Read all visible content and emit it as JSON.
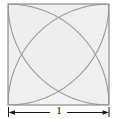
{
  "figure": {
    "square": {
      "side_label": "1",
      "x": 8,
      "y": 4,
      "size": 101,
      "stroke_color": "#8c8c8c",
      "stroke_width": 1.1,
      "fill_color": "#ffffff"
    },
    "arcs": {
      "count": 4,
      "description": "quarter circles of radius equal to the side, centered at each corner of the square",
      "stroke_color": "#9a9a9a",
      "stroke_width": 1.1,
      "radius": 101,
      "centers": [
        "bottom-left",
        "bottom-right",
        "top-left",
        "top-right"
      ]
    },
    "regions": {
      "petal_fill": "#ececec",
      "overlap_fill": "#e2e2e2",
      "outer_fill": "#f7f7f7"
    },
    "dimension": {
      "label": "1",
      "y": 112,
      "x_start": 8,
      "x_end": 109,
      "line_color": "#1a1a1a",
      "arrow_style": "double-headed"
    }
  }
}
